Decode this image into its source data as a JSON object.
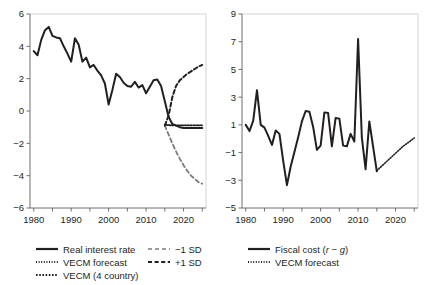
{
  "chart_data": [
    {
      "panel": "left",
      "type": "line",
      "title": "",
      "xlabel": "",
      "ylabel": "",
      "xlim": [
        1979,
        2026
      ],
      "ylim": [
        -6,
        6
      ],
      "yticks": [
        6,
        4,
        2,
        0,
        -2,
        -4,
        -6
      ],
      "xticks": [
        1980,
        1985,
        1990,
        1995,
        2000,
        2005,
        2010,
        2015,
        2020,
        2025
      ],
      "xticklabels": [
        "1980",
        "",
        "1990",
        "",
        "2000",
        "",
        "2010",
        "",
        "2020",
        ""
      ],
      "grid": false,
      "legend_position": "below",
      "series": [
        {
          "name": "Real interest rate",
          "style": "solid",
          "color": "#231f20",
          "width": 2.0,
          "x": [
            1980,
            1981,
            1982,
            1983,
            1984,
            1985,
            1986,
            1987,
            1988,
            1989,
            1990,
            1991,
            1992,
            1993,
            1994,
            1995,
            1996,
            1997,
            1998,
            1999,
            2000,
            2001,
            2002,
            2003,
            2004,
            2005,
            2006,
            2007,
            2008,
            2009,
            2010,
            2011,
            2012,
            2013,
            2014,
            2015,
            2016,
            2017,
            2018,
            2019,
            2020,
            2021,
            2022,
            2023,
            2024,
            2025
          ],
          "values": [
            3.7,
            3.45,
            4.4,
            5.0,
            5.2,
            4.65,
            4.55,
            4.5,
            4.0,
            3.55,
            3.05,
            4.5,
            4.1,
            3.05,
            3.3,
            2.7,
            2.85,
            2.5,
            2.2,
            1.7,
            0.4,
            1.3,
            2.3,
            2.1,
            1.75,
            1.55,
            1.5,
            1.8,
            1.45,
            1.6,
            1.1,
            1.5,
            1.9,
            1.95,
            1.55,
            0.6,
            -0.35,
            -0.8,
            -0.9,
            -1.0,
            -1.05,
            -1.05,
            -1.05,
            -1.05,
            -1.05,
            -1.05
          ]
        },
        {
          "name": "VECM forecast",
          "style": "dotted-fine",
          "color": "#231f20",
          "width": 1.6,
          "x": [
            2015,
            2016,
            2017,
            2018,
            2019,
            2020,
            2021,
            2022,
            2023,
            2024,
            2025
          ],
          "values": [
            -0.85,
            -0.88,
            -0.9,
            -0.9,
            -0.9,
            -0.9,
            -0.9,
            -0.9,
            -0.9,
            -0.9,
            -0.9
          ]
        },
        {
          "name": "VECM (4 country)",
          "style": "dotted-coarse",
          "color": "#231f20",
          "width": 1.6,
          "x": [
            2015,
            2016,
            2017,
            2018,
            2019,
            2020,
            2021,
            2022,
            2023,
            2024,
            2025
          ],
          "values": [
            -0.85,
            -0.87,
            -0.88,
            -0.88,
            -0.88,
            -0.88,
            -0.88,
            -0.88,
            -0.88,
            -0.88,
            -0.88
          ]
        },
        {
          "name": "-1 SD",
          "style": "dashed-light",
          "color": "#7a7a7a",
          "width": 1.8,
          "x": [
            2015,
            2016,
            2017,
            2018,
            2019,
            2020,
            2021,
            2022,
            2023,
            2024,
            2025
          ],
          "values": [
            -0.9,
            -1.45,
            -2.0,
            -2.5,
            -2.95,
            -3.35,
            -3.7,
            -4.0,
            -4.2,
            -4.4,
            -4.5
          ]
        },
        {
          "name": "+1 SD",
          "style": "dashed-dark",
          "color": "#231f20",
          "width": 2.0,
          "x": [
            2015,
            2016,
            2017,
            2018,
            2019,
            2020,
            2021,
            2022,
            2023,
            2024,
            2025
          ],
          "values": [
            -0.9,
            -0.3,
            0.85,
            1.55,
            1.9,
            2.1,
            2.3,
            2.45,
            2.6,
            2.75,
            2.85
          ]
        }
      ],
      "legend": [
        {
          "label": "Real interest rate",
          "style": "solid",
          "col": 0
        },
        {
          "label": "VECM forecast",
          "style": "dotted-fine",
          "col": 0
        },
        {
          "label": "VECM (4 country)",
          "style": "dotted-coarse",
          "col": 0
        },
        {
          "label": "-1 SD",
          "style": "dashed-light",
          "col": 1
        },
        {
          "label": "+1 SD",
          "style": "dashed-dark",
          "col": 1
        }
      ]
    },
    {
      "panel": "right",
      "type": "line",
      "title": "",
      "xlabel": "",
      "ylabel": "",
      "xlim": [
        1979,
        2026
      ],
      "ylim": [
        -5,
        9
      ],
      "yticks": [
        9,
        7,
        5,
        3,
        1,
        -1,
        -3,
        -5
      ],
      "xticks": [
        1980,
        1985,
        1990,
        1995,
        2000,
        2005,
        2010,
        2015,
        2020,
        2025
      ],
      "xticklabels": [
        "1980",
        "",
        "1990",
        "",
        "2000",
        "",
        "2010",
        "",
        "2020",
        ""
      ],
      "grid": false,
      "legend_position": "below",
      "series": [
        {
          "name": "Fiscal cost (r - g)",
          "style": "solid",
          "color": "#231f20",
          "width": 2.0,
          "x": [
            1980,
            1981,
            1982,
            1983,
            1984,
            1985,
            1986,
            1987,
            1988,
            1989,
            1990,
            1991,
            1992,
            1993,
            1994,
            1995,
            1996,
            1997,
            1998,
            1999,
            2000,
            2001,
            2002,
            2003,
            2004,
            2005,
            2006,
            2007,
            2008,
            2009,
            2010,
            2011,
            2012,
            2013,
            2014,
            2015
          ],
          "values": [
            1.0,
            0.55,
            1.3,
            3.5,
            1.0,
            0.8,
            0.2,
            -0.45,
            0.6,
            0.35,
            -1.6,
            -3.35,
            -2.0,
            -0.95,
            0.1,
            1.25,
            2.0,
            1.95,
            0.85,
            -0.8,
            -0.5,
            1.9,
            1.85,
            -0.55,
            1.5,
            1.45,
            -0.5,
            -0.55,
            0.35,
            -0.2,
            7.2,
            0.1,
            -2.2,
            1.25,
            -0.55,
            -2.35
          ]
        },
        {
          "name": "VECM forecast",
          "style": "dotted-fine",
          "color": "#231f20",
          "width": 1.6,
          "x": [
            2015,
            2016,
            2017,
            2018,
            2019,
            2020,
            2021,
            2022,
            2023,
            2024,
            2025
          ],
          "values": [
            -2.3,
            -2.05,
            -1.8,
            -1.55,
            -1.3,
            -1.05,
            -0.8,
            -0.55,
            -0.35,
            -0.15,
            0.05
          ]
        }
      ],
      "legend": [
        {
          "label": "Fiscal cost (",
          "label_italic_1": "r",
          "label_mid": " − ",
          "label_italic_2": "g",
          "label_end": ")",
          "style": "solid",
          "col": 0
        },
        {
          "label": "VECM forecast",
          "style": "dotted-fine",
          "col": 0
        }
      ]
    }
  ],
  "left_panel": {
    "yticklabels": [
      "6",
      "4",
      "2",
      "0",
      "-2",
      "-4",
      "-6"
    ],
    "xticklabels": [
      "1980",
      "1990",
      "2000",
      "2010",
      "2020"
    ],
    "legend": {
      "real_interest_rate": "Real interest rate",
      "vecm_forecast": "VECM forecast",
      "vecm_4_country": "VECM (4 country)",
      "minus_1_sd": "−1 SD",
      "plus_1_sd": "+1 SD"
    }
  },
  "right_panel": {
    "yticklabels": [
      "9",
      "7",
      "5",
      "3",
      "1",
      "-1",
      "-3",
      "-5"
    ],
    "xticklabels": [
      "1980",
      "1990",
      "2000",
      "2010",
      "2020"
    ],
    "legend": {
      "fiscal_cost_prefix": "Fiscal cost (",
      "fiscal_cost_r": "r",
      "fiscal_cost_minus": " − ",
      "fiscal_cost_g": "g",
      "fiscal_cost_suffix": ")",
      "vecm_forecast": "VECM forecast"
    }
  },
  "colors": {
    "ink": "#231f20",
    "axis": "#6f6f6f",
    "light_dash": "#7a7a7a",
    "background": "#ffffff"
  }
}
